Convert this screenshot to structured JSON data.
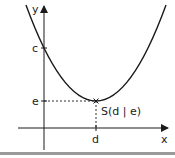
{
  "diagram": {
    "type": "parabola-vertex",
    "axes": {
      "x_label": "x",
      "y_label": "y"
    },
    "labels": {
      "y_intercept": "c",
      "vertex_y": "e",
      "vertex_x": "d",
      "vertex_point": "S(d | e)"
    },
    "colors": {
      "curve": "#1a1a1a",
      "axis": "#1a1a1a",
      "guide": "#333333",
      "bottom_bar": "#9a9a9a"
    }
  }
}
